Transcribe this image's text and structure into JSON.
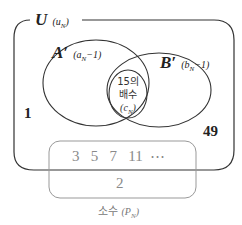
{
  "diagram": {
    "type": "venn",
    "universe": {
      "name": "U",
      "subscript_label": "(u",
      "subscript_n": "N",
      "subscript_close": ")"
    },
    "set_a": {
      "name": "A′",
      "label": "(a",
      "label_n": "N",
      "label_tail": "−1)"
    },
    "set_b": {
      "name": "B′",
      "label": "(b",
      "label_n": "N",
      "label_tail": "−1)"
    },
    "intersection": {
      "line1": "15의",
      "line2": "배수",
      "line3": "(c",
      "line3_n": "N",
      "line3_close": ")"
    },
    "outside_numbers": {
      "left": "1",
      "right": "49"
    },
    "primes_box": {
      "values": [
        "3",
        "5",
        "7",
        "11",
        "⋯"
      ],
      "outside_value": "2",
      "caption": "소수",
      "caption_label": "(P",
      "caption_n": "N",
      "caption_close": ")"
    },
    "colors": {
      "outline": "#333333",
      "primes_outline": "#999999",
      "primes_text": "#8a8a8a"
    }
  }
}
